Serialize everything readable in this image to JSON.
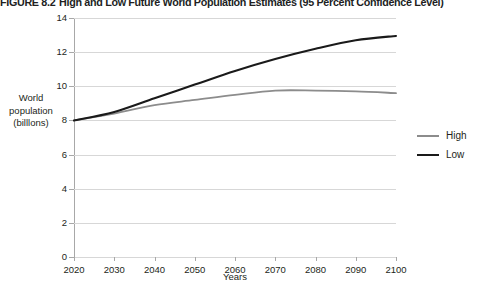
{
  "figure": {
    "number": "FIGURE 8.2",
    "title": "High and Low Future World Population Estimates (95 Percent Confidence Level)"
  },
  "chart_data": {
    "type": "line",
    "title": "High and Low Future World Population Estimates (95 Percent Confidence Level)",
    "xlabel": "Years",
    "ylabel": "World population (billlons)",
    "ylabel_lines": [
      "World",
      "population",
      "(billlons)"
    ],
    "x": [
      2020,
      2030,
      2040,
      2050,
      2060,
      2070,
      2080,
      2090,
      2100
    ],
    "categories": [
      "2020",
      "2030",
      "2040",
      "2050",
      "2060",
      "2070",
      "2080",
      "2090",
      "2100"
    ],
    "xlim": [
      2020,
      2100
    ],
    "ylim": [
      0,
      14
    ],
    "yticks": [
      0,
      2,
      4,
      6,
      8,
      10,
      12,
      14
    ],
    "ytick_labels": [
      "0",
      "2",
      "4",
      "6",
      "8",
      "10",
      "12",
      "14"
    ],
    "grid": true,
    "legend_position": "right",
    "series": [
      {
        "name": "High",
        "color": "#8c8c8c",
        "values": [
          8.0,
          8.4,
          8.9,
          9.2,
          9.5,
          9.75,
          9.75,
          9.7,
          9.6
        ]
      },
      {
        "name": "Low",
        "color": "#1a1a1a",
        "values": [
          8.0,
          8.5,
          9.3,
          10.1,
          10.9,
          11.6,
          12.2,
          12.7,
          12.95
        ]
      }
    ]
  },
  "legend": {
    "items": [
      {
        "label": "High",
        "color": "#8c8c8c"
      },
      {
        "label": "Low",
        "color": "#1a1a1a"
      }
    ]
  }
}
